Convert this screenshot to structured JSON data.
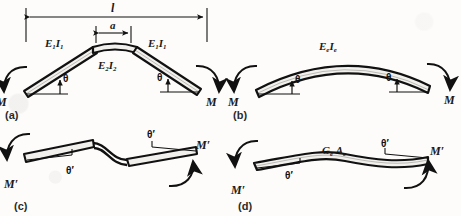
{
  "figure": {
    "ink_color": "#111111",
    "beam_fill": "#f2f0ec",
    "background": "#fdfcfa"
  },
  "dimensions": {
    "overall_span_label": "l",
    "center_segment_label": "a"
  },
  "panels": [
    {
      "id": "a",
      "label": "(a)",
      "caption_label": "(a)",
      "description": "two-segment bent beam with stiffer central portion",
      "member_labels": [
        {
          "name": "left-segment-stiffness",
          "text": "E1I1"
        },
        {
          "name": "center-segment-stiffness",
          "text": "E2I2"
        },
        {
          "name": "right-segment-stiffness",
          "text": "E1I1"
        }
      ],
      "angle_labels": [
        {
          "name": "left-rotation",
          "text": "θ"
        },
        {
          "name": "right-rotation",
          "text": "θ"
        }
      ],
      "moment_labels": [
        {
          "name": "left-moment",
          "text": "M"
        },
        {
          "name": "right-moment",
          "text": "M"
        }
      ]
    },
    {
      "id": "b",
      "label": "(b)",
      "caption_label": "(b)",
      "description": "equivalent uniform curved beam in pure bending",
      "member_labels": [
        {
          "name": "equivalent-flexural-stiffness",
          "text": "EeIe"
        }
      ],
      "angle_labels": [
        {
          "name": "left-rotation",
          "text": "θ"
        },
        {
          "name": "right-rotation",
          "text": "θ"
        }
      ],
      "moment_labels": [
        {
          "name": "left-moment",
          "text": "M"
        },
        {
          "name": "right-moment",
          "text": "M"
        }
      ]
    },
    {
      "id": "c",
      "label": "(c)",
      "caption_label": "(c)",
      "description": "two-segment beam in antisymmetric shear deformation",
      "member_labels": [],
      "angle_labels": [
        {
          "name": "left-rotation",
          "text": "θ′"
        },
        {
          "name": "right-rotation",
          "text": "θ′"
        }
      ],
      "moment_labels": [
        {
          "name": "left-moment",
          "text": "M′"
        },
        {
          "name": "right-moment",
          "text": "M′"
        }
      ]
    },
    {
      "id": "d",
      "label": "(d)",
      "caption_label": "(d)",
      "description": "equivalent uniform beam in shear deformation",
      "member_labels": [
        {
          "name": "equivalent-shear-stiffness",
          "text": "GeAe"
        }
      ],
      "angle_labels": [
        {
          "name": "left-rotation",
          "text": "θ′"
        },
        {
          "name": "right-rotation",
          "text": "θ′"
        }
      ],
      "moment_labels": [
        {
          "name": "left-moment",
          "text": "M′"
        },
        {
          "name": "right-moment",
          "text": "M′"
        }
      ]
    }
  ],
  "symbols": {
    "E1I1": {
      "base1": "E",
      "sub1": "1",
      "base2": "I",
      "sub2": "1"
    },
    "E2I2": {
      "base1": "E",
      "sub1": "2",
      "base2": "I",
      "sub2": "2"
    },
    "EeIe": {
      "base1": "E",
      "sub1": "e",
      "base2": "I",
      "sub2": "e"
    },
    "GeAe": {
      "base1": "G",
      "sub1": "e",
      "base2": "A",
      "sub2": "e"
    },
    "theta": "θ",
    "theta_prime": "θ′",
    "M": "M",
    "M_prime": "M′",
    "span_l": "l",
    "span_a": "a"
  }
}
